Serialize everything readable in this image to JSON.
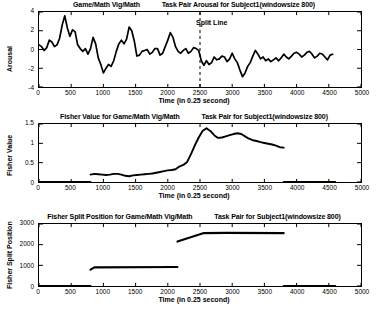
{
  "figure": {
    "time_unit_label": "Time (in 0.25 second)",
    "split_line_label": "Split Line"
  },
  "panels": {
    "arousal": {
      "title_left": "Game/Math Vig/Math",
      "title_right": "Task Pair Arousal for Subject1(windowsize 800)",
      "ylabel": "Arousal",
      "xlabel": "Time (in 0.25 second)",
      "yticks": [
        "-4",
        "-2",
        "0",
        "2",
        "4"
      ],
      "xticks": [
        "0",
        "500",
        "1000",
        "1500",
        "2000",
        "2500",
        "3000",
        "3500",
        "4000",
        "4500",
        "5000"
      ],
      "annotation": "Split Line"
    },
    "fisher": {
      "title_left": "Fisher Value for Game/Math Vig/Math",
      "title_right": "Task Pair for Subject1(windowsize 800)",
      "ylabel": "Fisher Value",
      "xlabel": "Time (in 0.25 second)",
      "yticks": [
        "0",
        "0.5",
        "1",
        "1.5"
      ],
      "xticks": [
        "0",
        "500",
        "1000",
        "1500",
        "2000",
        "2500",
        "3000",
        "3500",
        "4000",
        "4500",
        "5000"
      ]
    },
    "split": {
      "title_left": "Fisher Split Position for Game/Math Vig/Math",
      "title_right": "Task Pair for Subject1(windowsize 800)",
      "ylabel": "Fisher Split Position",
      "xlabel": "Time (in 0.25 second)",
      "yticks": [
        "0",
        "1000",
        "2000",
        "3000"
      ],
      "xticks": [
        "0",
        "500",
        "1000",
        "1500",
        "2000",
        "2500",
        "3000",
        "3500",
        "4000",
        "4500",
        "5000"
      ]
    }
  },
  "chart_data": [
    {
      "type": "line",
      "id": "arousal",
      "title": "Task Pair Arousal for Subject1(windowsize 800)",
      "xlabel": "Time (in 0.25 second)",
      "ylabel": "Arousal",
      "xlim": [
        0,
        5000
      ],
      "ylim": [
        -4,
        4
      ],
      "grid": false,
      "legend": "none",
      "annotations": [
        {
          "text": "Split Line",
          "x": 2500,
          "style": "dashed-vertical"
        }
      ],
      "x": [
        0,
        40,
        80,
        120,
        160,
        200,
        240,
        280,
        320,
        360,
        400,
        440,
        480,
        520,
        560,
        600,
        640,
        680,
        720,
        760,
        800,
        840,
        880,
        920,
        960,
        1000,
        1040,
        1080,
        1120,
        1160,
        1200,
        1240,
        1280,
        1320,
        1360,
        1400,
        1440,
        1480,
        1520,
        1560,
        1600,
        1640,
        1680,
        1720,
        1760,
        1800,
        1840,
        1880,
        1920,
        1960,
        2000,
        2040,
        2080,
        2120,
        2160,
        2200,
        2240,
        2280,
        2320,
        2360,
        2400,
        2440,
        2480,
        2520,
        2560,
        2600,
        2640,
        2680,
        2720,
        2760,
        2800,
        2840,
        2880,
        2920,
        2960,
        3000,
        3040,
        3080,
        3120,
        3160,
        3200,
        3240,
        3280,
        3320,
        3360,
        3400,
        3440,
        3480,
        3520,
        3560,
        3600,
        3640,
        3680,
        3720,
        3760,
        3800,
        3840,
        3880,
        3920,
        3960,
        4000,
        4040,
        4080,
        4120,
        4160,
        4200,
        4240,
        4280,
        4320,
        4360,
        4400,
        4440,
        4480,
        4520,
        4560,
        4600
      ],
      "y": [
        0.5,
        0.3,
        -0.1,
        0.2,
        1.0,
        0.8,
        0.3,
        0.5,
        1.2,
        2.6,
        3.6,
        2.3,
        1.4,
        2.1,
        1.9,
        0.5,
        0.1,
        -0.2,
        0.1,
        -0.5,
        0.1,
        1.3,
        0.6,
        -0.9,
        -1.6,
        -2.5,
        -2.0,
        -1.6,
        -1.8,
        -1.2,
        -0.2,
        0.6,
        1.0,
        0.6,
        1.1,
        2.4,
        2.0,
        0.9,
        -0.7,
        -0.6,
        -0.2,
        -0.1,
        0.0,
        -0.5,
        -0.3,
        0.1,
        0.1,
        -0.6,
        -0.4,
        0.3,
        1.0,
        1.8,
        1.3,
        0.3,
        -0.2,
        -0.4,
        -0.1,
        0.1,
        -0.4,
        -0.2,
        0.2,
        0.1,
        -0.1,
        -1.2,
        -1.7,
        -1.2,
        -1.6,
        -1.4,
        -0.8,
        -1.1,
        -1.0,
        -0.7,
        -0.8,
        -1.3,
        -1.0,
        -0.4,
        -1.0,
        -1.4,
        -2.2,
        -2.9,
        -2.5,
        -1.8,
        -1.4,
        -0.7,
        -0.1,
        -0.5,
        -1.0,
        -0.8,
        -1.2,
        -1.0,
        -1.3,
        -1.1,
        -0.9,
        -1.2,
        -0.9,
        -0.5,
        -0.8,
        -1.0,
        -0.7,
        -0.4,
        -0.3,
        -0.5,
        -0.8,
        -0.6,
        -0.3,
        -0.2,
        -0.5,
        -0.9,
        -0.7,
        -0.4,
        -0.5,
        -0.8,
        -1.1,
        -0.6,
        -0.5
      ]
    },
    {
      "type": "line",
      "id": "fisher_value",
      "title": "Fisher Value for Game/Math Vig/Math Task Pair for Subject1(windowsize 800)",
      "xlabel": "Time (in 0.25 second)",
      "ylabel": "Fisher Value",
      "xlim": [
        0,
        5000
      ],
      "ylim": [
        0,
        1.5
      ],
      "grid": false,
      "legend": "none",
      "segments": [
        {
          "x": [
            0,
            800
          ],
          "y": [
            0,
            0
          ]
        },
        {
          "x": [
            800,
            860,
            920,
            980,
            1040,
            1100,
            1160,
            1220,
            1280,
            1340,
            1400,
            1460,
            1520,
            1580,
            1640,
            1700,
            1760,
            1820,
            1880,
            1940,
            2000,
            2060,
            2120,
            2180,
            2240,
            2300,
            2360,
            2420,
            2480,
            2540,
            2600,
            2660,
            2720,
            2780,
            2840,
            2900,
            2960,
            3020,
            3080,
            3140,
            3200,
            3260,
            3320,
            3380,
            3440,
            3500,
            3560,
            3620,
            3680,
            3740,
            3800
          ],
          "y": [
            0.19,
            0.21,
            0.2,
            0.19,
            0.18,
            0.19,
            0.21,
            0.21,
            0.19,
            0.16,
            0.15,
            0.17,
            0.18,
            0.19,
            0.2,
            0.21,
            0.22,
            0.24,
            0.26,
            0.28,
            0.3,
            0.31,
            0.33,
            0.4,
            0.44,
            0.52,
            0.72,
            0.95,
            1.15,
            1.32,
            1.39,
            1.32,
            1.21,
            1.14,
            1.15,
            1.18,
            1.21,
            1.24,
            1.26,
            1.24,
            1.18,
            1.12,
            1.08,
            1.06,
            1.03,
            1.01,
            0.99,
            0.97,
            0.94,
            0.9,
            0.89
          ]
        },
        {
          "x": [
            3800,
            4600
          ],
          "y": [
            0,
            0
          ]
        }
      ]
    },
    {
      "type": "line",
      "id": "fisher_split_position",
      "title": "Fisher Split Position for Game/Math Vig/Math Task Pair for Subject1(windowsize 800)",
      "xlabel": "Time (in 0.25 second)",
      "ylabel": "Fisher Split Position",
      "xlim": [
        0,
        5000
      ],
      "ylim": [
        0,
        3000
      ],
      "grid": false,
      "legend": "none",
      "segments": [
        {
          "x": [
            0,
            800
          ],
          "y": [
            0,
            0
          ]
        },
        {
          "x": [
            800,
            860,
            2150
          ],
          "y": [
            790,
            900,
            920
          ]
        },
        {
          "x": [
            2150,
            2560,
            2900,
            3800
          ],
          "y": [
            2150,
            2560,
            2570,
            2560
          ]
        },
        {
          "x": [
            3800,
            4600
          ],
          "y": [
            0,
            0
          ]
        }
      ]
    }
  ]
}
